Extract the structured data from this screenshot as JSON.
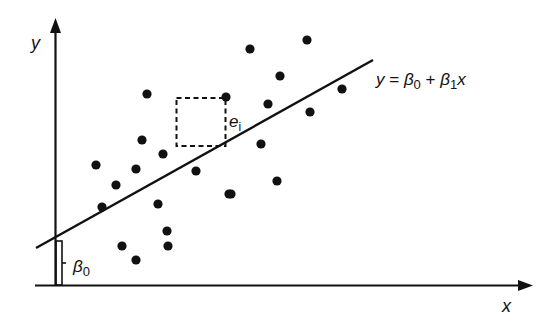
{
  "diagram": {
    "axes": {
      "x_label": "x",
      "y_label": "y"
    },
    "regression_line": {
      "equation_parts": {
        "y": "y",
        "eq": " = ",
        "beta": "β",
        "sub0": "0",
        "plus": " + ",
        "sub1": "1",
        "x": "x"
      },
      "equation_text": "y = β0 + β1x"
    },
    "intercept_label": {
      "beta": "β",
      "sub": "0",
      "text": "β0"
    },
    "residual_label": {
      "e": "e",
      "sub": "i",
      "text": "ei"
    },
    "colors": {
      "ink": "#111111",
      "background": "#ffffff"
    }
  },
  "chart_data": {
    "type": "scatter",
    "title": "",
    "xlabel": "x",
    "ylabel": "y",
    "grid": false,
    "legend": "none",
    "annotations": [
      "y = β0 + β1x",
      "β0 (intercept)",
      "ei (residual with dashed square)"
    ],
    "points_pixel": [
      [
        147,
        94
      ],
      [
        226,
        97
      ],
      [
        142,
        140
      ],
      [
        163,
        154
      ],
      [
        96,
        165
      ],
      [
        136,
        169
      ],
      [
        196,
        171
      ],
      [
        116,
        185
      ],
      [
        102,
        207
      ],
      [
        158,
        204
      ],
      [
        229,
        194
      ],
      [
        167,
        231
      ],
      [
        122,
        246
      ],
      [
        168,
        246
      ],
      [
        136,
        260
      ],
      [
        250,
        49
      ],
      [
        307,
        40
      ],
      [
        280,
        76
      ],
      [
        342,
        89
      ],
      [
        268,
        104
      ],
      [
        310,
        112
      ],
      [
        261,
        144
      ],
      [
        277,
        181
      ],
      [
        231,
        194
      ]
    ],
    "line_pixel": {
      "x1": 36,
      "y1": 248,
      "x2": 373,
      "y2": 60
    }
  }
}
